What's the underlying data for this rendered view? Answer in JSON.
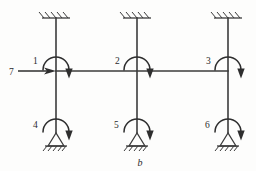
{
  "figure": {
    "caption": "b",
    "type": "structural-frame-degrees-of-freedom-diagram"
  },
  "labels": {
    "dof1": "1",
    "dof2": "2",
    "dof3": "3",
    "dof4": "4",
    "dof5": "5",
    "dof6": "6",
    "dof7": "7"
  },
  "nodes": [
    {
      "id": "1",
      "label": "1",
      "x": 56,
      "y": 71,
      "kind": "beam-column-joint",
      "dof": "rotation"
    },
    {
      "id": "2",
      "label": "2",
      "x": 137,
      "y": 71,
      "kind": "beam-column-joint",
      "dof": "rotation"
    },
    {
      "id": "3",
      "label": "3",
      "x": 228,
      "y": 71,
      "kind": "beam-column-joint",
      "dof": "rotation"
    },
    {
      "id": "4",
      "label": "4",
      "x": 56,
      "y": 133,
      "kind": "pinned-support",
      "dof": "rotation"
    },
    {
      "id": "5",
      "label": "5",
      "x": 137,
      "y": 133,
      "kind": "pinned-support",
      "dof": "rotation"
    },
    {
      "id": "6",
      "label": "6",
      "x": 228,
      "y": 133,
      "kind": "pinned-support",
      "dof": "rotation"
    }
  ],
  "members": {
    "beam": {
      "x1": 56,
      "y1": 71,
      "x2": 228,
      "y2": 71
    },
    "columns": [
      {
        "x": 56,
        "y_top": 18,
        "y_bottom": 133
      },
      {
        "x": 137,
        "y_top": 18,
        "y_bottom": 133
      },
      {
        "x": 228,
        "y_top": 18,
        "y_bottom": 133
      }
    ]
  },
  "supports": {
    "top": [
      {
        "x": 56,
        "y": 18,
        "kind": "fixed"
      },
      {
        "x": 137,
        "y": 18,
        "kind": "fixed"
      },
      {
        "x": 228,
        "y": 18,
        "kind": "fixed"
      }
    ],
    "bottom": [
      {
        "x": 56,
        "y": 133,
        "kind": "pinned"
      },
      {
        "x": 137,
        "y": 133,
        "kind": "pinned"
      },
      {
        "x": 228,
        "y": 133,
        "kind": "pinned"
      }
    ]
  },
  "loads": {
    "horizontal_force": {
      "label": "7",
      "x_start": 18,
      "x_end": 56,
      "y": 71,
      "direction": "right"
    },
    "moments": [
      {
        "label": "1",
        "at_node": "1",
        "sense": "clockwise"
      },
      {
        "label": "2",
        "at_node": "2",
        "sense": "clockwise"
      },
      {
        "label": "3",
        "at_node": "3",
        "sense": "clockwise"
      },
      {
        "label": "4",
        "at_node": "4",
        "sense": "clockwise"
      },
      {
        "label": "5",
        "at_node": "5",
        "sense": "clockwise"
      },
      {
        "label": "6",
        "at_node": "6",
        "sense": "clockwise"
      }
    ]
  },
  "colors": {
    "line": "#3b3b3b",
    "arrow": "#2e2e2e",
    "background": "#fdfdfc",
    "text": "#2b2b2b"
  }
}
